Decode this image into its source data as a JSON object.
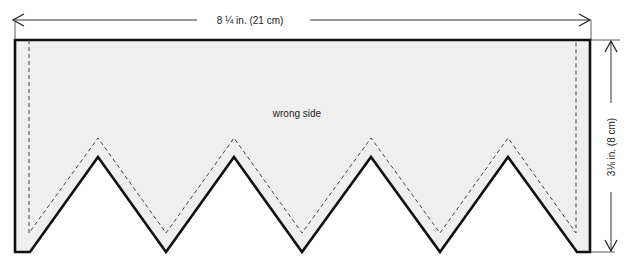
{
  "diagram": {
    "type": "sewing-pattern-piece",
    "piece_label": "wrong side",
    "width_label": "8 ¼  in. (21 cm)",
    "height_label": "3⅛ in. (8 cm)",
    "colors": {
      "fill": "#efefef",
      "outline": "#111111",
      "seam_line": "#444444",
      "dimension_line": "#333333",
      "background": "#ffffff"
    },
    "shape": {
      "outline_points": "15,40 590,40 590,252 577,252 508,157 440,252 371,157 302,252 234,157 166,252 98,157 30,252 15,252",
      "seam_points": "29,40 29,233 98,138 166,233 234,138 302,233 371,138 440,233 508,138 576,233 576,40",
      "points_count": 4
    }
  }
}
